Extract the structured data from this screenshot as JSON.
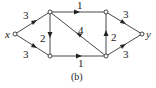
{
  "caption": "(b)",
  "nodes": [
    {
      "id": "x",
      "label": "x",
      "cx": 15,
      "cy": 34
    },
    {
      "id": "a",
      "label": "",
      "cx": 50,
      "cy": 12
    },
    {
      "id": "b",
      "label": "",
      "cx": 50,
      "cy": 56
    },
    {
      "id": "c",
      "label": "",
      "cx": 106,
      "cy": 12
    },
    {
      "id": "d",
      "label": "",
      "cx": 106,
      "cy": 56
    },
    {
      "id": "y",
      "label": "y",
      "cx": 142,
      "cy": 34
    }
  ],
  "edges": [
    {
      "from": "x",
      "to": "a",
      "weight": "3"
    },
    {
      "from": "x",
      "to": "b",
      "weight": "3"
    },
    {
      "from": "a",
      "to": "c",
      "weight": "1"
    },
    {
      "from": "b",
      "to": "d",
      "weight": "1"
    },
    {
      "from": "a",
      "to": "b",
      "weight": "2"
    },
    {
      "from": "d",
      "to": "a",
      "weight": "4"
    },
    {
      "from": "d",
      "to": "c",
      "weight": "2"
    },
    {
      "from": "c",
      "to": "y",
      "weight": "3"
    },
    {
      "from": "d",
      "to": "y",
      "weight": "3"
    }
  ]
}
